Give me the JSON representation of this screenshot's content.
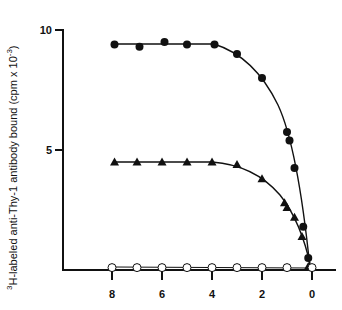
{
  "chart_data": {
    "type": "scatter",
    "title": "",
    "xlabel": "",
    "ylabel_sup": "3",
    "ylabel": "H-labeled anti-Thy-1 antibody bound (cpm x 10",
    "ylabel_exp": "-3",
    "ylabel_close": ")",
    "x_reversed": true,
    "xlim": [
      8,
      0
    ],
    "ylim": [
      0,
      10
    ],
    "x_ticks": [
      8,
      6,
      4,
      2,
      0
    ],
    "x_tick_labels": [
      "8",
      "6",
      "4",
      "2",
      "0"
    ],
    "y_ticks": [
      5,
      10
    ],
    "y_tick_labels": [
      "5",
      "10"
    ],
    "grid": false,
    "legend": null,
    "series": [
      {
        "name": "filled circles",
        "marker": "filled-circle",
        "x": [
          7.9,
          6.9,
          5.9,
          5.0,
          3.9,
          3.0,
          2.0,
          1.0,
          0.9,
          0.7,
          0.35,
          0.15
        ],
        "y": [
          9.4,
          9.3,
          9.5,
          9.4,
          9.4,
          9.0,
          8.0,
          5.75,
          5.4,
          4.25,
          1.8,
          0.5
        ]
      },
      {
        "name": "filled triangles",
        "marker": "filled-triangle",
        "x": [
          7.9,
          7.0,
          6.0,
          5.0,
          4.0,
          3.0,
          2.0,
          1.1,
          1.0,
          0.7,
          0.4,
          0.15
        ],
        "y": [
          4.5,
          4.5,
          4.5,
          4.5,
          4.5,
          4.4,
          3.8,
          2.8,
          2.6,
          2.2,
          1.4,
          0.15
        ]
      },
      {
        "name": "open circles",
        "marker": "open-circle",
        "x": [
          8,
          7,
          6,
          5,
          4,
          3,
          2,
          1,
          0
        ],
        "y": [
          0.1,
          0.1,
          0.1,
          0.1,
          0.1,
          0.1,
          0.1,
          0.1,
          0.1
        ]
      }
    ]
  }
}
